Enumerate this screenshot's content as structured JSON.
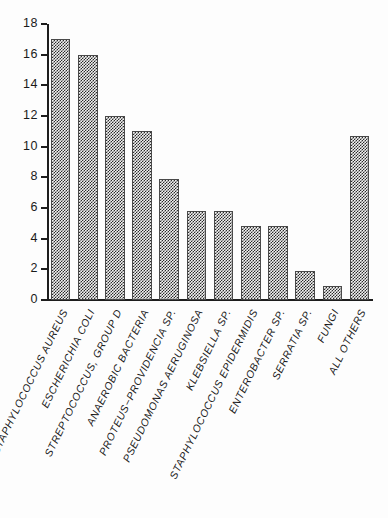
{
  "chart_data": {
    "type": "bar",
    "title": "",
    "subtitle": "",
    "xlabel": "",
    "ylabel": "",
    "ylim": [
      0,
      18
    ],
    "ytick_step": 2,
    "yticks": [
      18,
      16,
      14,
      12,
      10,
      8,
      6,
      4,
      2,
      0
    ],
    "grid": false,
    "legend": null,
    "orientation": "vertical",
    "bar_fill": "checkerboard-dither",
    "categories": [
      "STAPHYLOCOCCUS AUREUS",
      "ESCHERICHIA COLI",
      "STREPTOCOCCUS, GROUP D",
      "ANAEROBIC BACTERIA",
      "PROTEUS−PROVIDENCIA SP.",
      "PSEUDOMONAS AERUGINOSA",
      "KLEBSIELLA SP.",
      "STAPHYLOCOCCUS EPIDERMIDIS",
      "ENTEROBACTER SP.",
      "SERRATIA SP.",
      "FUNGI",
      "ALL OTHERS"
    ],
    "values": [
      17,
      16,
      12,
      11,
      7.9,
      5.8,
      5.8,
      4.8,
      4.8,
      1.9,
      0.9,
      10.7
    ]
  },
  "style": {
    "axis_color": "#1d1d1d",
    "bar_edge_color": "#4a4a4a",
    "bar_dither_color": "#2a2a2a",
    "background": "#fdfdfd",
    "text_color": "#1a1a1a"
  }
}
